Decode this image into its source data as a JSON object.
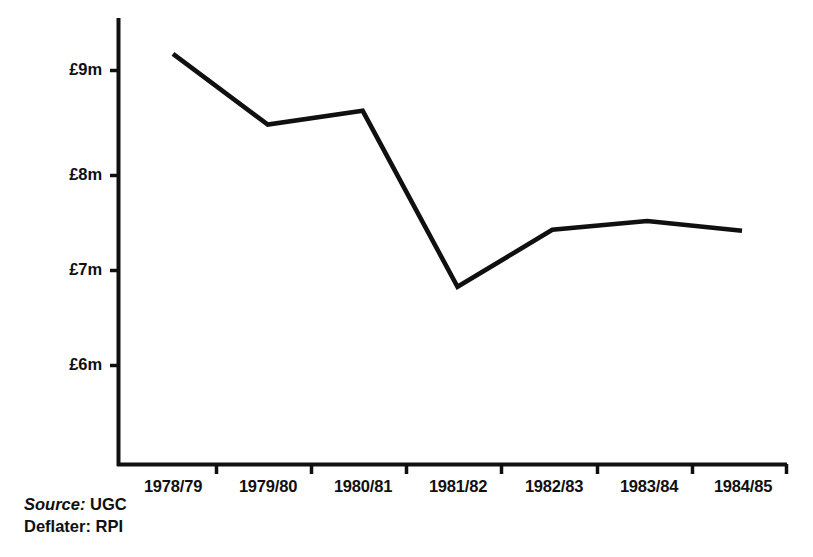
{
  "chart_data": {
    "type": "line",
    "title": "",
    "subtitle": "",
    "xlabel": "",
    "ylabel": "",
    "categories": [
      "1978/79",
      "1979/80",
      "1980/81",
      "1981/82",
      "1982/83",
      "1983/84",
      "1984/85"
    ],
    "values": [
      9.17,
      8.45,
      8.59,
      6.8,
      7.38,
      7.47,
      7.37
    ],
    "series": [
      {
        "name": "Expenditure",
        "values": [
          9.17,
          8.45,
          8.59,
          6.8,
          7.38,
          7.47,
          7.37
        ]
      }
    ],
    "y_ticks": [
      {
        "value": 9,
        "label": "£9m"
      },
      {
        "value": 8,
        "label": "£8m"
      },
      {
        "value": 7,
        "label": "£7m"
      },
      {
        "value": 6,
        "label": "£6m"
      }
    ],
    "ylim": [
      5.2,
      9.5
    ],
    "grid": false,
    "legend": "none",
    "units": "£m",
    "line_color": "#101010"
  },
  "axes": {
    "y_tick_labels": [
      "£9m",
      "£8m",
      "£7m",
      "£6m"
    ],
    "x_tick_labels": [
      "1978/79",
      "1979/80",
      "1980/81",
      "1981/82",
      "1982/83",
      "1983/84",
      "1984/85"
    ]
  },
  "footnote": {
    "source_key": "Source:",
    "source_value": "UGC",
    "deflater_key": "Deflater:",
    "deflater_value": "RPI"
  },
  "colors": {
    "ink": "#101010",
    "background": "#ffffff"
  }
}
